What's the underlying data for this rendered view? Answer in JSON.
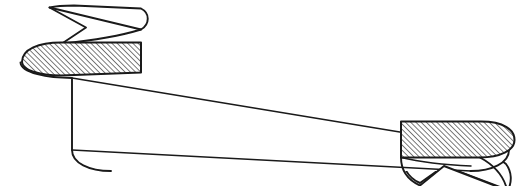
{
  "canvas": {
    "width": 527,
    "height": 186,
    "background_color": "#ffffff"
  },
  "illustration": {
    "name": "swallowtail-ribbon-banner",
    "kind": "line-art-ribbon",
    "description": "Blank decorative ribbon banner drawn in black line art with two hatched fold panels and two swallowtail streamer ends",
    "title_text": "",
    "stroke_color": "#1a1a1a",
    "fill_color": "#ffffff",
    "hatch_color": "#1a1a1a",
    "stroke_width": 1.8,
    "thin_stroke_width": 1.4,
    "hatch_angle_degrees": 45,
    "hatch_spacing": 2.6,
    "hatch_line_width": 1.0
  },
  "geometry": {
    "main_band": {
      "name": "main-banner-band",
      "fill": "#ffffff",
      "path": "M 20 63 C 20 50 34 44 52 44 L 470 128 C 492 128 508 136 508 150 C 508 163 492 171 470 171 L 110 171 C 88 171 72 163 72 150 L 72 78 C 50 78 20 76 20 63 Z",
      "top_edge": "M 72 78 L 508 150",
      "bottom_edge": "M 72 150 L 470 171"
    },
    "left_curl": {
      "name": "left-ribbon-curl",
      "cx": 46,
      "cy": 63,
      "rx": 26,
      "ry": 19
    },
    "right_curl": {
      "name": "right-ribbon-curl",
      "cx": 490,
      "cy": 150,
      "rx": 25,
      "ry": 19
    },
    "left_fold": {
      "name": "left-hatched-fold",
      "hatched": true,
      "path": "M 22 62 C 22 50 38 43 60 43 L 140 43 L 140 72 L 60 75 C 38 75 22 70 22 62 Z"
    },
    "right_fold": {
      "name": "right-hatched-fold",
      "hatched": true,
      "path": "M 402 122 L 482 122 C 504 122 514 130 514 140 C 514 150 500 157 480 157 L 402 157 Z"
    },
    "left_tail": {
      "name": "left-swallowtail-streamer",
      "hatched": false,
      "path": "M 50 8 L 138 30 C 144 26 145 18 138 13 L 74 7 Z",
      "tip": [
        50,
        8
      ],
      "notch_apex": [
        85,
        27
      ]
    },
    "right_tail": {
      "name": "right-swallowtail-streamer",
      "hatched": false,
      "tip": [
        500,
        186
      ],
      "notch_apex": [
        444,
        166
      ]
    }
  },
  "labels": {
    "banner_caption": ""
  }
}
